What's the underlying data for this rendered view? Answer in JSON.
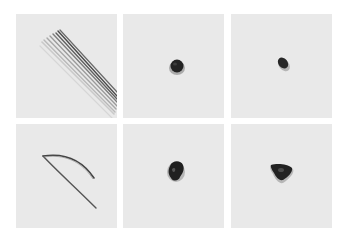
{
  "figure": {
    "layout": "2x3 grid",
    "background": "#ffffff",
    "panel_background": "#e9e9e9",
    "panels": [
      {
        "row": 1,
        "col": 1,
        "subject": "bundle of straight strips",
        "description": "several parallel thin strips lying diagonally"
      },
      {
        "row": 1,
        "col": 2,
        "subject": "small round dark object",
        "description": "single small dark round blob centered"
      },
      {
        "row": 1,
        "col": 3,
        "subject": "small oval dark object",
        "description": "single small dark oval blob, tilted"
      },
      {
        "row": 2,
        "col": 1,
        "subject": "bent strip",
        "description": "a single strip bent into a V / curved shape"
      },
      {
        "row": 2,
        "col": 2,
        "subject": "dark irregular clump",
        "description": "dark crumpled clump, slightly larger"
      },
      {
        "row": 2,
        "col": 3,
        "subject": "dark triangular clump",
        "description": "dark triangular-shaped clump"
      }
    ]
  }
}
